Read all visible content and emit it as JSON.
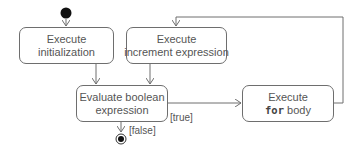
{
  "diagram": {
    "type": "UML activity diagram",
    "nodes": {
      "init": {
        "line1": "Execute",
        "line2": "initialization"
      },
      "increment": {
        "line1": "Execute",
        "line2": "increment expression"
      },
      "evaluate": {
        "line1": "Evaluate boolean",
        "line2": "expression"
      },
      "body": {
        "line1": "Execute",
        "keyword": "for",
        "line2_rest": " body"
      }
    },
    "guards": {
      "true": "[true]",
      "false": "[false]"
    },
    "colors": {
      "line": "#6e6e6e",
      "text": "#555555",
      "start_node": "#111111"
    }
  }
}
